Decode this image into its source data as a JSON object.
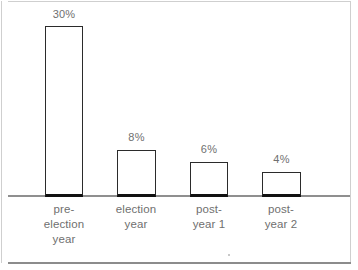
{
  "chart_data": {
    "type": "bar",
    "title": "",
    "subtitle": "",
    "xlabel": "",
    "ylabel": "",
    "grid": false,
    "legend": null,
    "axis": {
      "baseline_visible": true,
      "y_axis_visible": false,
      "ylim": [
        0,
        30
      ],
      "value_suffix": "%"
    },
    "categories": [
      "pre-\nelection\nyear",
      "election\nyear",
      "post-\nyear 1",
      "post-\nyear 2"
    ],
    "values": [
      30,
      8,
      6,
      4
    ],
    "data_labels": [
      "30%",
      "8%",
      "6%",
      "4%"
    ],
    "colors": {
      "bar_fill": "#ffffff",
      "bar_stroke": "#2b2b2b",
      "bar_base_stroke": "#111111",
      "axis_line": "#8f8f8f",
      "label_text": "#6f6f6f",
      "frame_line": "#cfcfcf",
      "background": "#ffffff"
    }
  },
  "bars": [
    {
      "label": "30%",
      "category": "pre-\nelection\nyear",
      "value": 30,
      "left": 45,
      "width": 38,
      "top": 26,
      "height": 171,
      "label_left": 45,
      "label_top": 8,
      "cat_left": 25,
      "cat_width": 78
    },
    {
      "label": "8%",
      "category": "election\nyear",
      "value": 8,
      "left": 117,
      "width": 39,
      "top": 150,
      "height": 47,
      "label_left": 117,
      "label_top": 131,
      "cat_left": 97,
      "cat_width": 78
    },
    {
      "label": "6%",
      "category": "post-\nyear 1",
      "value": 6,
      "left": 190,
      "width": 38,
      "top": 162,
      "height": 35,
      "label_left": 190,
      "label_top": 143,
      "cat_left": 170,
      "cat_width": 78
    },
    {
      "label": "4%",
      "category": "post-\nyear 2",
      "value": 4,
      "left": 262,
      "width": 39,
      "top": 172,
      "height": 25,
      "label_left": 262,
      "label_top": 153,
      "cat_left": 242,
      "cat_width": 78
    }
  ]
}
